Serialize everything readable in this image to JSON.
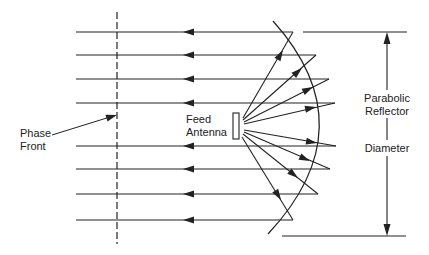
{
  "diagram": {
    "labels": {
      "phase_front_line1": "Phase",
      "phase_front_line2": "Front",
      "feed_line1": "Feed",
      "feed_line2": "Antenna",
      "reflector_line1": "Parabolic",
      "reflector_line2": "Reflector",
      "diameter": "Diameter"
    },
    "colors": {
      "stroke": "#222222",
      "background": "#ffffff"
    },
    "rays": [
      {
        "y": 32,
        "reflect_x": 293
      },
      {
        "y": 55,
        "reflect_x": 316
      },
      {
        "y": 79,
        "reflect_x": 329
      },
      {
        "y": 103,
        "reflect_x": 335
      },
      {
        "y": 146,
        "reflect_x": 336
      },
      {
        "y": 169,
        "reflect_x": 330
      },
      {
        "y": 194,
        "reflect_x": 318
      },
      {
        "y": 220,
        "reflect_x": 293
      }
    ]
  }
}
